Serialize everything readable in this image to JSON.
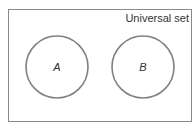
{
  "diagram": {
    "type": "venn",
    "universal_set_label": "Universal set",
    "sets": [
      {
        "label": "A",
        "cx": 57,
        "cy": 67,
        "r": 31
      },
      {
        "label": "B",
        "cx": 143,
        "cy": 67,
        "r": 31
      }
    ],
    "colors": {
      "border": "#7a7a7a",
      "circle_stroke": "#808080",
      "text": "#333333",
      "background": "#ffffff"
    }
  }
}
